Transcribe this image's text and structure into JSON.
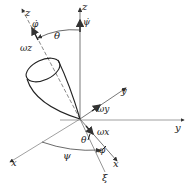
{
  "diagram": {
    "labels": {
      "z_fixed": "z",
      "psi_dot": "ψ̇",
      "z_body": "z",
      "phi_dot": "φ̇",
      "omega_z": "ωz",
      "theta_top": "θ",
      "y_body": "y",
      "omega_y": "ωy",
      "y_fixed": "y",
      "x_fixed": "x",
      "psi_bottom": "ψ",
      "theta_bottom": "θ",
      "phi_bottom": "φ",
      "omega_x": "ωx",
      "x_body": "x",
      "xi": "ξ"
    },
    "colors": {
      "line": "#333333",
      "thin": "#666666",
      "background": "#ffffff"
    }
  }
}
